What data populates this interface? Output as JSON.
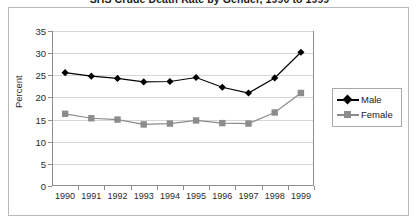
{
  "chart_data": {
    "type": "line",
    "title": "SHS Crude Death Rate by Gender, 1990 to 1999",
    "xlabel": "",
    "ylabel": "Percent",
    "categories": [
      "1990",
      "1991",
      "1992",
      "1993",
      "1994",
      "1995",
      "1996",
      "1997",
      "1998",
      "1999"
    ],
    "series": [
      {
        "name": "Male",
        "color": "#000000",
        "marker": "diamond",
        "values": [
          25.6,
          24.8,
          24.3,
          23.5,
          23.6,
          24.5,
          22.3,
          21.0,
          24.4,
          30.2
        ]
      },
      {
        "name": "Female",
        "color": "#8c8c8c",
        "marker": "square",
        "values": [
          16.3,
          15.3,
          15.0,
          13.9,
          14.1,
          14.8,
          14.2,
          14.1,
          16.6,
          21.0
        ]
      }
    ],
    "ylim": [
      0,
      35
    ],
    "ytick_step": 5,
    "yticks": [
      0,
      5,
      10,
      15,
      20,
      25,
      30,
      35
    ],
    "grid": true,
    "legend_position": "right"
  },
  "legend": {
    "entries": [
      {
        "label": "Male"
      },
      {
        "label": "Female"
      }
    ]
  }
}
